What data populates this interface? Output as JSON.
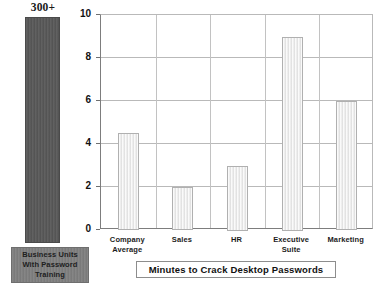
{
  "chart_data": {
    "type": "bar",
    "title": "",
    "xlabel": "Minutes to Crack Desktop Passwords",
    "ylabel": "",
    "categories": [
      "Company\nAverage",
      "Sales",
      "HR",
      "Executive Suite",
      "Marketing"
    ],
    "values": [
      4.5,
      2,
      3,
      9,
      6
    ],
    "ylim": [
      0,
      10
    ],
    "yticks": [
      0,
      2,
      4,
      6,
      8,
      10
    ],
    "ytick_labels": [
      "0",
      "2",
      "4",
      "6",
      "8",
      "10"
    ],
    "grid": true,
    "legend_position": "none",
    "bar_color": "#efefef",
    "bar_border_color": "#b0b0b0",
    "gridline_color": "#b9b9b9",
    "annotations": [
      {
        "name": "overflow-bar",
        "label": "300+",
        "description": "Business Units With Password Training",
        "color": "#585858"
      }
    ]
  },
  "overflow": {
    "value_label": "300+",
    "legend_label": "Business Units\nWith Password\nTraining",
    "bar_color": "#585858",
    "legend_color": "#7f7f7f"
  },
  "axis_title": {
    "text": "Minutes to Crack Desktop Passwords"
  }
}
